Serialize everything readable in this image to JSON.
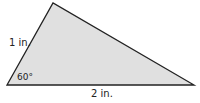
{
  "diagram": {
    "shape": "triangle",
    "fill_color": "#e0e0e0",
    "stroke_color": "#222222",
    "labels": {
      "left_side": "1 in.",
      "bottom_side": "2 in.",
      "angle": "60°"
    }
  }
}
